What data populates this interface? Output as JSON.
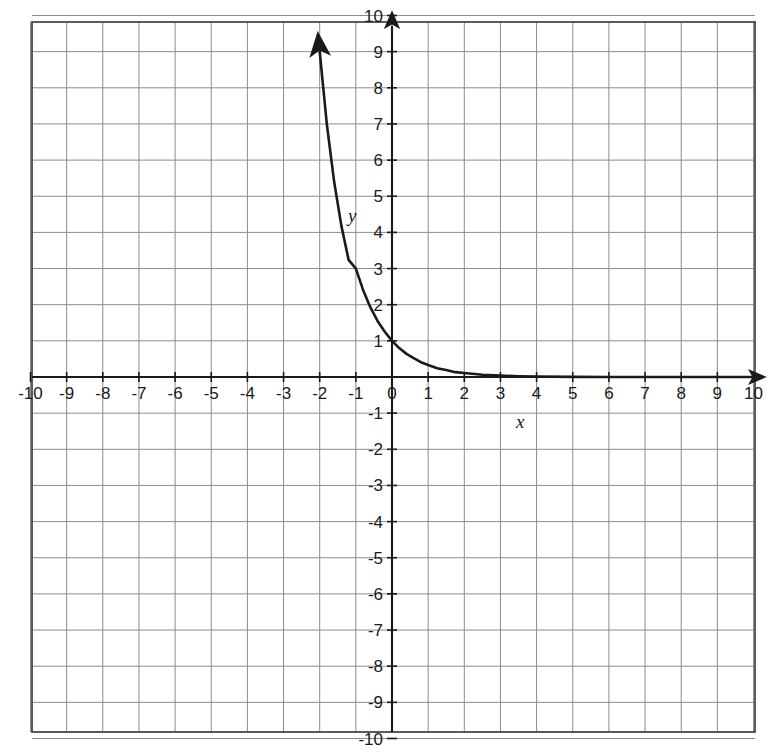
{
  "chart_data": {
    "type": "line",
    "title": "",
    "subtitle": "",
    "xlabel": "x",
    "ylabel": "y",
    "xlim": [
      -10,
      10
    ],
    "ylim": [
      -10,
      10
    ],
    "grid": true,
    "grid_step": 1,
    "legend": null,
    "legend_position": "none",
    "x_tick_labels": [
      "-10",
      "-9",
      "-8",
      "-7",
      "-6",
      "-5",
      "-4",
      "-3",
      "-2",
      "-1",
      "0",
      "1",
      "2",
      "3",
      "4",
      "5",
      "6",
      "7",
      "8",
      "9",
      "10"
    ],
    "y_tick_labels": [
      "10",
      "9",
      "8",
      "7",
      "6",
      "5",
      "4",
      "3",
      "2",
      "1",
      "-1",
      "-2",
      "-3",
      "-4",
      "-5",
      "-6",
      "-7",
      "-8",
      "-9",
      "-10"
    ],
    "x_ticks": [
      -10,
      -9,
      -8,
      -7,
      -6,
      -5,
      -4,
      -3,
      -2,
      -1,
      0,
      1,
      2,
      3,
      4,
      5,
      6,
      7,
      8,
      9,
      10
    ],
    "y_ticks": [
      10,
      9,
      8,
      7,
      6,
      5,
      4,
      3,
      2,
      1,
      -1,
      -2,
      -3,
      -4,
      -5,
      -6,
      -7,
      -8,
      -9,
      -10
    ],
    "series": [
      {
        "name": "y = (1/3)^x",
        "equation": "y = (1/3)^x",
        "color": "#1a1a1a",
        "arrow_start": true,
        "arrow_end": false,
        "x": [
          -2.095,
          -2.0,
          -1.8,
          -1.6,
          -1.4,
          -1.2,
          -1.0,
          -0.8,
          -0.6,
          -0.4,
          -0.2,
          0.0,
          0.2,
          0.4,
          0.6,
          0.8,
          1.0,
          1.25,
          1.5,
          1.75,
          2.0,
          2.5,
          3.0,
          3.5,
          4.0,
          5.0,
          6.0,
          7.0,
          8.0,
          9.0,
          10.0
        ],
        "y": [
          10.0,
          9.0,
          6.97,
          5.4,
          4.18,
          3.24,
          3.0,
          2.41,
          1.93,
          1.55,
          1.25,
          1.0,
          0.8,
          0.64,
          0.52,
          0.41,
          0.333,
          0.24,
          0.192,
          0.134,
          0.111,
          0.064,
          0.037,
          0.021,
          0.0123,
          0.0041,
          0.0014,
          0.00046,
          0.00015,
          5e-05,
          1.7e-05
        ]
      }
    ],
    "annotations": [
      {
        "text": "y",
        "x": -1.1,
        "y": 4.3,
        "style": "italic"
      },
      {
        "text": "x",
        "x": 3.55,
        "y": -1.4,
        "style": "italic"
      }
    ]
  },
  "colors": {
    "grid_line": "#8c8c8c",
    "grid_border": "#4a4a4a",
    "axis": "#1a1a1a",
    "curve": "#1a1a1a",
    "background": "#ffffff",
    "tick_text": "#1a1a1a"
  },
  "geometry": {
    "origin_x": 392,
    "origin_y": 377,
    "cell": 36.15,
    "plot_left": 32,
    "plot_top": 22,
    "plot_right": 755,
    "plot_bottom": 732
  }
}
